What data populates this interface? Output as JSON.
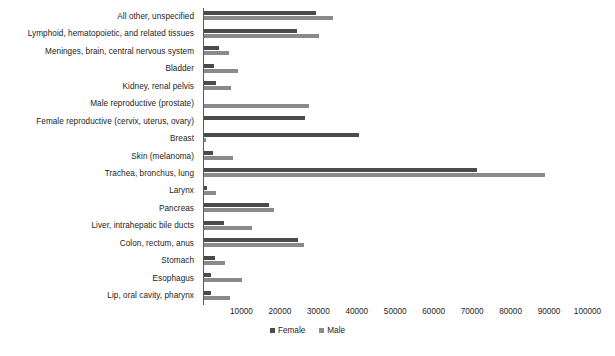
{
  "chart_data": {
    "type": "bar",
    "orientation": "horizontal",
    "title": "",
    "xlabel": "",
    "ylabel": "",
    "xlim": [
      0,
      100000
    ],
    "grid": false,
    "legend_position": "bottom",
    "xticks": [
      10000,
      20000,
      30000,
      40000,
      50000,
      60000,
      70000,
      80000,
      90000,
      100000
    ],
    "xtick_labels": [
      "10000",
      "20000",
      "30000",
      "40000",
      "50000",
      "60000",
      "70000",
      "80000",
      "90000",
      "100000"
    ],
    "categories": [
      "All other, unspecified",
      "Lymphoid, hematopoietic, and related tissues",
      "Meninges, brain, central nervous system",
      "Bladder",
      "Kidney, renal pelvis",
      "Male reproductive (prostate)",
      "Female reproductive (cervix, uterus, ovary)",
      "Breast",
      "Skin (melanoma)",
      "Trachea, bronchus, lung",
      "Larynx",
      "Pancreas",
      "Liver, intrahepatic bile ducts",
      "Colon, rectum, anus",
      "Stomach",
      "Esophagus",
      "Lip, oral cavity, pharynx"
    ],
    "series": [
      {
        "name": "Female",
        "color": "#4b4b4b",
        "values": [
          29200,
          24200,
          3900,
          2500,
          3100,
          0,
          26300,
          40300,
          2300,
          71000,
          800,
          16900,
          5100,
          24400,
          2800,
          1800,
          1900
        ]
      },
      {
        "name": "Male",
        "color": "#8a8a8a",
        "values": [
          33600,
          29900,
          6500,
          8800,
          7000,
          27300,
          0,
          400,
          7600,
          88700,
          3100,
          18200,
          12400,
          26100,
          5500,
          9900,
          6800
        ]
      }
    ]
  },
  "legend": {
    "items": [
      {
        "label": "Female",
        "color": "#4b4b4b"
      },
      {
        "label": "Male",
        "color": "#8a8a8a"
      }
    ]
  }
}
